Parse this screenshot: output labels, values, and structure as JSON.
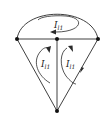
{
  "diagram": {
    "type": "circuit-graph",
    "colors": {
      "stroke": "#2a2a2a",
      "node": "#111111",
      "background": "#ffffff"
    },
    "nodes": [
      {
        "id": "left",
        "x": 17,
        "y": 39
      },
      {
        "id": "middle",
        "x": 57,
        "y": 39
      },
      {
        "id": "right",
        "x": 98,
        "y": 39
      },
      {
        "id": "bottom",
        "x": 57,
        "y": 111
      }
    ],
    "edges": [
      {
        "from": "left",
        "to": "middle",
        "kind": "straight"
      },
      {
        "from": "middle",
        "to": "right",
        "kind": "straight"
      },
      {
        "from": "left",
        "to": "right",
        "kind": "arc-top"
      },
      {
        "from": "left",
        "to": "bottom",
        "kind": "straight"
      },
      {
        "from": "middle",
        "to": "bottom",
        "kind": "straight"
      },
      {
        "from": "right",
        "to": "bottom",
        "kind": "straight"
      }
    ],
    "loops": [
      {
        "id": "top-loop",
        "label_main": "I",
        "label_sub": "l1",
        "direction": "counterclockwise"
      },
      {
        "id": "left-loop",
        "label_main": "I",
        "label_sub": "l1",
        "direction": "clockwise"
      },
      {
        "id": "right-loop",
        "label_main": "I",
        "label_sub": "l1",
        "direction": "counterclockwise"
      }
    ]
  }
}
